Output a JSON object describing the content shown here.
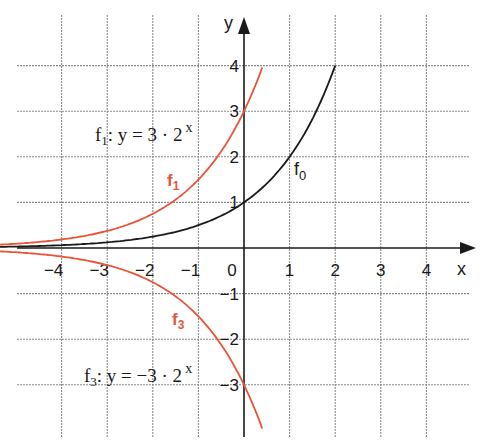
{
  "chart_data": {
    "type": "line",
    "title": "",
    "xlabel": "x",
    "ylabel": "y",
    "xlim": [
      -5,
      5
    ],
    "ylim": [
      -4,
      4.5
    ],
    "grid": true,
    "x_ticks": [
      "-4",
      "-3",
      "-2",
      "-1",
      "0",
      "1",
      "2",
      "3",
      "4"
    ],
    "y_ticks": [
      "4",
      "3",
      "2",
      "1",
      "-1",
      "-2",
      "-3"
    ],
    "origin_label": "0",
    "series": [
      {
        "name": "f0",
        "label": "f",
        "label_sub": "0",
        "formula": "y = 2^x",
        "color": "#1a1a1a",
        "x": [
          -5,
          -4,
          -3,
          -2,
          -1,
          0,
          1,
          2
        ],
        "values": [
          0.03,
          0.06,
          0.13,
          0.25,
          0.5,
          1,
          2,
          4
        ]
      },
      {
        "name": "f1",
        "label": "f",
        "label_sub": "1",
        "formula_prefix": "f",
        "formula_sub": "1",
        "formula_body": ":  y = 3 · 2",
        "formula_exp": "x",
        "color": "#e8553a",
        "x": [
          -5,
          -4,
          -3,
          -2,
          -1,
          0,
          0.4
        ],
        "values": [
          0.09,
          0.19,
          0.38,
          0.75,
          1.5,
          3,
          3.96
        ]
      },
      {
        "name": "f3",
        "label": "f",
        "label_sub": "3",
        "formula_prefix": "f",
        "formula_sub": "3",
        "formula_body": ":  y = −3 · 2",
        "formula_exp": "x",
        "color": "#e8553a",
        "x": [
          -5,
          -4,
          -3,
          -2,
          -1,
          0,
          0.4
        ],
        "values": [
          -0.09,
          -0.19,
          -0.38,
          -0.75,
          -1.5,
          -3,
          -3.96
        ]
      }
    ]
  }
}
